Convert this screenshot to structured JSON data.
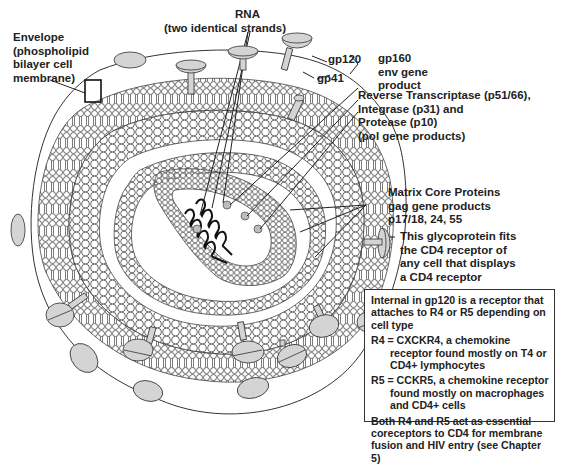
{
  "labels": {
    "envelope": [
      "Envelope",
      "(phospholipid",
      "bilayer cell",
      "membrane)"
    ],
    "rna": [
      "RNA",
      "(two identical strands)"
    ],
    "gp120": "gp120",
    "gp41": "gp41",
    "gp160": [
      "gp160",
      "env gene",
      "product"
    ],
    "pol": [
      "Reverse Transcriptase (p51/66),",
      "Integrase (p31) and",
      "Protease (p10)",
      "(pol gene products)"
    ],
    "gag": [
      "Matrix Core Proteins",
      "gag gene products",
      "p17/18, 24, 55"
    ],
    "glycoprotein": [
      "This glycoprotein fits",
      "the CD4 receptor of",
      "any cell that displays",
      "a CD4 receptor"
    ]
  },
  "infobox": {
    "intro": "Internal in gp120 is a receptor that attaches to R4 or R5 depending on cell type",
    "r4": "R4 = CXCKR4, a chemokine receptor found mostly on T4 or CD4+ lymphocytes",
    "r5": "R5 = CCKR5, a chemokine receptor found mostly on macrophages and CD4+ cells",
    "both": "Both R4 and R5 act as essential coreceptors to CD4 for membrane fusion and HIV entry (see Chapter 5)"
  },
  "colors": {
    "stroke": "#333333",
    "knob_fill": "#d4d4d4",
    "background": "#ffffff"
  }
}
